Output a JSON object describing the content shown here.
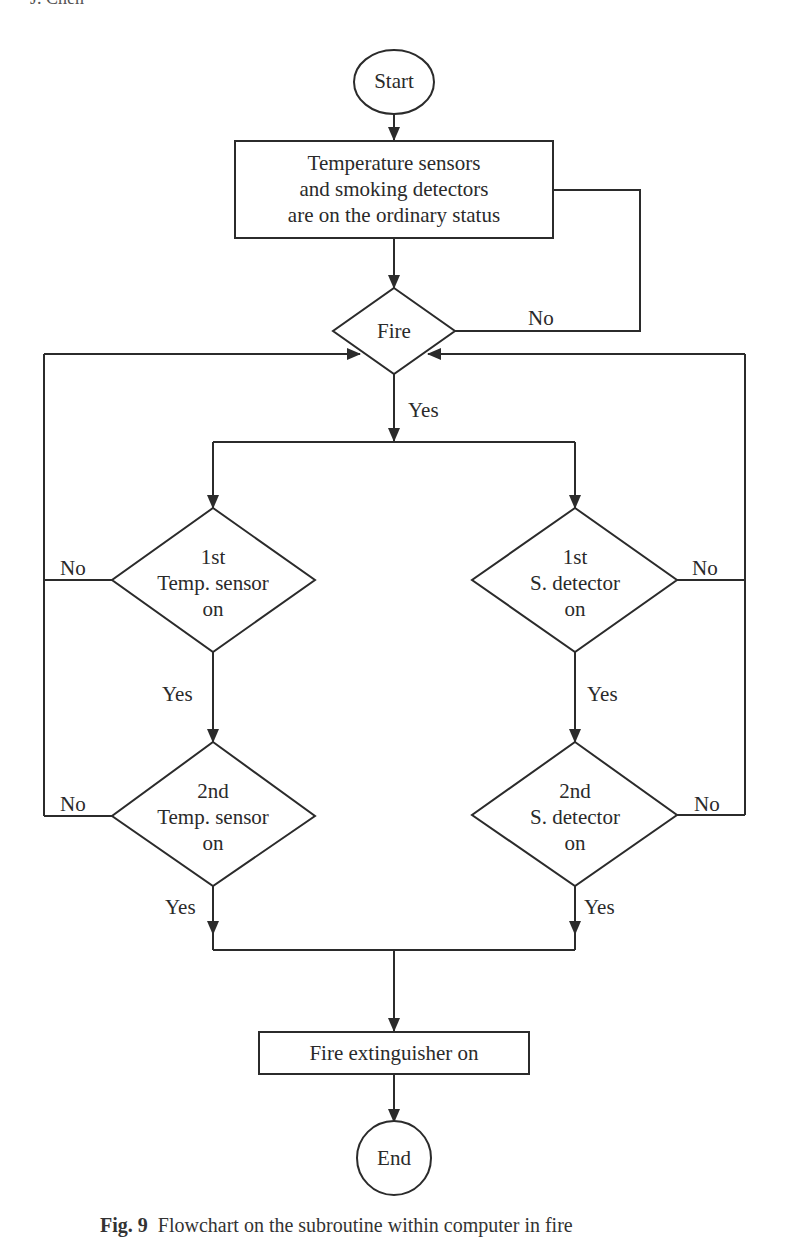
{
  "header_fragment": "J. Chen",
  "nodes": {
    "start": {
      "label": "Start"
    },
    "initial_status": {
      "lines": [
        "Temperature sensors",
        "and smoking detectors",
        "are on the ordinary status"
      ]
    },
    "fire_decision": {
      "label": "Fire"
    },
    "temp1": {
      "lines": [
        "1st",
        "Temp. sensor",
        "on"
      ]
    },
    "temp2": {
      "lines": [
        "2nd",
        "Temp. sensor",
        "on"
      ]
    },
    "smoke1": {
      "lines": [
        "1st",
        "S. detector",
        "on"
      ]
    },
    "smoke2": {
      "lines": [
        "2nd",
        "S. detector",
        "on"
      ]
    },
    "extinguisher": {
      "label": "Fire extinguisher on"
    },
    "end": {
      "label": "End"
    }
  },
  "edge_labels": {
    "fire_no": "No",
    "fire_yes": "Yes",
    "temp1_no": "No",
    "temp1_yes": "Yes",
    "temp2_no": "No",
    "temp2_yes": "Yes",
    "smoke1_no": "No",
    "smoke1_yes": "Yes",
    "smoke2_no": "No",
    "smoke2_yes": "Yes"
  },
  "caption": {
    "prefix": "Fig. 9",
    "text": "Flowchart on the subroutine within computer in fire"
  },
  "colors": {
    "line": "#2b2b2b",
    "background": "#ffffff"
  }
}
